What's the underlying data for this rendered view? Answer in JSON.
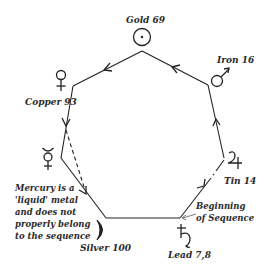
{
  "diagram": {
    "type": "heptagon-sequence",
    "colors": {
      "line": "#222222",
      "text": "#2a2a2a",
      "background": "#ffffff"
    },
    "nodes": [
      {
        "id": "gold",
        "label": "Gold 69",
        "symbol": "sun-icon",
        "glyph": "☉"
      },
      {
        "id": "iron",
        "label": "Iron 16",
        "symbol": "mars-icon",
        "glyph": "♂"
      },
      {
        "id": "tin",
        "label": "Tin 14",
        "symbol": "jupiter-icon",
        "glyph": "♃"
      },
      {
        "id": "lead",
        "label": "Lead 7,8",
        "symbol": "saturn-icon",
        "glyph": "♄"
      },
      {
        "id": "silver",
        "label": "Silver 100",
        "symbol": "moon-icon",
        "glyph": "☽"
      },
      {
        "id": "mercury",
        "label": "",
        "symbol": "mercury-icon",
        "glyph": "☿"
      },
      {
        "id": "copper",
        "label": "Copper 93",
        "symbol": "venus-icon",
        "glyph": "♀"
      }
    ],
    "sequence": [
      "lead",
      "tin",
      "iron",
      "gold",
      "copper",
      "mercury",
      "silver",
      "lead"
    ],
    "start_annotation": [
      "Beginning",
      "of Sequence"
    ],
    "mercury_note": [
      "Mercury is a",
      "'liquid' metal",
      "and does not",
      "properly belong",
      "to the sequence"
    ]
  }
}
